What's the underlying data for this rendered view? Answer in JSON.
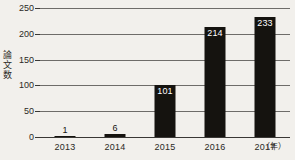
{
  "chart_data": {
    "type": "bar",
    "title": "",
    "subtitle": "",
    "categories": [
      "2013",
      "2014",
      "2015",
      "2016",
      "2017"
    ],
    "values": [
      1,
      6,
      101,
      214,
      233
    ],
    "value_labels": [
      "1",
      "6",
      "101",
      "214",
      "233"
    ],
    "xlabel": "",
    "x_unit": "（年）",
    "ylabel": "論文数",
    "ylabel_chars": [
      "論",
      "文",
      "数"
    ],
    "ylim": [
      0,
      250
    ],
    "yticks": [
      0,
      50,
      100,
      150,
      200,
      250
    ],
    "ytick_labels": [
      "0",
      "50",
      "100",
      "150",
      "200",
      "250"
    ],
    "grid": true,
    "grid_orientation": "horizontal",
    "legend": false,
    "legend_position": "none",
    "bar_color": "#15130f",
    "grid_color": "#6e6c69",
    "axis_color": "#3a3835",
    "background_color": "#f2f0ec",
    "text_color": "#2b2925",
    "inside_label_color": "#ffffff"
  }
}
